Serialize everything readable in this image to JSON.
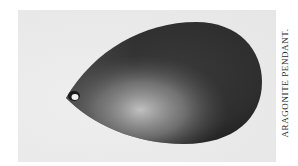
{
  "figure": {
    "caption": "ARAGONITE PENDANT.",
    "colors": {
      "page": "#ffffff",
      "plate_background": "#ececec",
      "pendant_dark": "#2b2b2b",
      "pendant_highlight": "#bdbdbd"
    }
  }
}
